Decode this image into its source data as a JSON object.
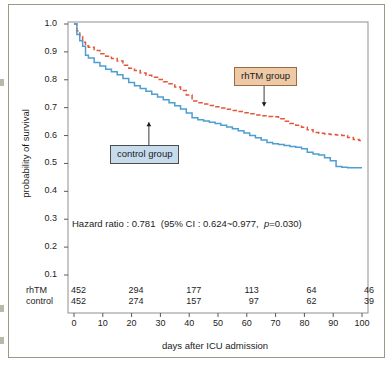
{
  "chart_data": {
    "type": "line",
    "title": "",
    "xlabel": "days after ICU admission",
    "ylabel": "probability of survival",
    "xlim": [
      0,
      100
    ],
    "ylim": [
      0.1,
      1.0
    ],
    "xticks": [
      0,
      10,
      20,
      30,
      40,
      50,
      60,
      70,
      80,
      90,
      100
    ],
    "xtick_labels": [
      "0",
      "10",
      "20",
      "30",
      "40",
      "50",
      "60",
      "70",
      "80",
      "90",
      "100"
    ],
    "yticks": [
      0.1,
      0.2,
      0.3,
      0.4,
      0.5,
      0.6,
      0.7,
      0.8,
      0.9,
      1.0
    ],
    "ytick_labels": [
      "0.1",
      "0.2",
      "0.3",
      "0.4",
      "0.5",
      "0.6",
      "0.7",
      "0.8",
      "0.9",
      "1.0"
    ],
    "grid": false,
    "legend_position": "inline-annotations",
    "series": [
      {
        "name": "rhTM group",
        "color": "#e2563c",
        "style": "dashed",
        "x": [
          0,
          1,
          2,
          3,
          4,
          5,
          7,
          9,
          11,
          13,
          15,
          17,
          19,
          21,
          23,
          25,
          27,
          29,
          31,
          33,
          35,
          37,
          39,
          41,
          43,
          45,
          47,
          49,
          51,
          53,
          55,
          57,
          59,
          61,
          63,
          65,
          67,
          69,
          71,
          73,
          75,
          77,
          79,
          81,
          83,
          85,
          87,
          89,
          91,
          93,
          95,
          97,
          99,
          100
        ],
        "y": [
          1.0,
          0.975,
          0.955,
          0.935,
          0.922,
          0.917,
          0.905,
          0.893,
          0.884,
          0.876,
          0.867,
          0.852,
          0.841,
          0.833,
          0.824,
          0.816,
          0.809,
          0.801,
          0.793,
          0.786,
          0.774,
          0.762,
          0.745,
          0.724,
          0.718,
          0.713,
          0.708,
          0.703,
          0.699,
          0.694,
          0.69,
          0.686,
          0.682,
          0.678,
          0.674,
          0.671,
          0.668,
          0.667,
          0.66,
          0.651,
          0.643,
          0.637,
          0.63,
          0.621,
          0.611,
          0.608,
          0.606,
          0.604,
          0.602,
          0.6,
          0.593,
          0.586,
          0.582,
          0.58
        ]
      },
      {
        "name": "control group",
        "color": "#4f9ed0",
        "style": "solid",
        "x": [
          0,
          1,
          2,
          3,
          4,
          5,
          7,
          9,
          11,
          13,
          15,
          17,
          19,
          21,
          23,
          25,
          27,
          29,
          31,
          33,
          35,
          37,
          39,
          41,
          43,
          45,
          47,
          49,
          51,
          53,
          55,
          57,
          59,
          61,
          63,
          65,
          67,
          69,
          71,
          73,
          75,
          77,
          79,
          81,
          83,
          85,
          87,
          89,
          91,
          93,
          95,
          97,
          99,
          100
        ],
        "y": [
          1.0,
          0.962,
          0.94,
          0.92,
          0.888,
          0.878,
          0.862,
          0.849,
          0.838,
          0.829,
          0.818,
          0.805,
          0.79,
          0.779,
          0.769,
          0.759,
          0.748,
          0.738,
          0.728,
          0.718,
          0.707,
          0.695,
          0.681,
          0.664,
          0.657,
          0.652,
          0.648,
          0.643,
          0.637,
          0.631,
          0.624,
          0.617,
          0.609,
          0.6,
          0.592,
          0.584,
          0.575,
          0.571,
          0.568,
          0.564,
          0.561,
          0.558,
          0.553,
          0.54,
          0.534,
          0.53,
          0.52,
          0.51,
          0.489,
          0.486,
          0.485,
          0.485,
          0.485,
          0.485
        ]
      }
    ],
    "annotations": [
      {
        "id": "rhtm-group",
        "text": "rhTM group",
        "target_x": 66,
        "target_y": 0.705,
        "arrow": "down"
      },
      {
        "id": "control-group",
        "text": "control group",
        "target_x": 26,
        "target_y": 0.648,
        "arrow": "up"
      }
    ],
    "statistics": {
      "full_text": "Hazard ratio : 0.781  (95% CI : 0.624~0.977,  p=0.030)",
      "hazard_ratio_label": "Hazard ratio : 0.781",
      "ci_open": "(95% CI : 0.624~0.977,",
      "p_italic": "p",
      "p_value": "=0.030)",
      "hazard_ratio": 0.781,
      "ci_lower": 0.624,
      "ci_upper": 0.977,
      "p": 0.03
    },
    "risk_table": {
      "time_points": [
        0,
        20,
        40,
        60,
        80,
        100
      ],
      "rows": [
        {
          "label": "rhTM",
          "values": [
            "452",
            "294",
            "177",
            "113",
            "64",
            "46"
          ]
        },
        {
          "label": "control",
          "values": [
            "452",
            "274",
            "157",
            "97",
            "62",
            "39"
          ]
        }
      ]
    }
  }
}
